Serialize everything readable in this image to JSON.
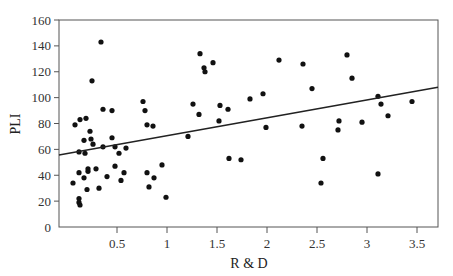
{
  "chart_data": {
    "type": "scatter",
    "title": "",
    "xlabel": "R & D",
    "ylabel": "PLI",
    "xlim": [
      -0.08,
      3.71
    ],
    "ylim": [
      0,
      160
    ],
    "xticks": [
      0.5,
      1,
      1.5,
      2,
      2.5,
      3,
      3.5
    ],
    "xtick_labels": [
      "0.5",
      "1",
      "1.5",
      "2",
      "2.5",
      "3",
      "3.5"
    ],
    "yticks": [
      0,
      20,
      40,
      60,
      80,
      100,
      120,
      140,
      160
    ],
    "ytick_labels": [
      "0",
      "20",
      "40",
      "60",
      "80",
      "100",
      "120",
      "140",
      "160"
    ],
    "grid": false,
    "legend": null,
    "point_color": "#111111",
    "line_color": "#222222",
    "trend_line": {
      "x": [
        -0.08,
        3.71
      ],
      "y": [
        55.6,
        108
      ]
    },
    "points": [
      [
        0.34,
        143
      ],
      [
        0.25,
        113
      ],
      [
        0.36,
        91
      ],
      [
        0.45,
        90
      ],
      [
        0.76,
        97
      ],
      [
        0.78,
        90
      ],
      [
        0.08,
        79
      ],
      [
        0.13,
        83
      ],
      [
        0.19,
        84
      ],
      [
        0.8,
        79
      ],
      [
        0.86,
        78
      ],
      [
        0.23,
        74
      ],
      [
        0.17,
        67
      ],
      [
        0.24,
        68
      ],
      [
        0.26,
        64
      ],
      [
        0.45,
        69
      ],
      [
        0.36,
        62
      ],
      [
        0.48,
        62
      ],
      [
        0.52,
        57
      ],
      [
        0.59,
        61
      ],
      [
        0.12,
        58
      ],
      [
        0.18,
        57
      ],
      [
        0.12,
        42
      ],
      [
        0.21,
        45
      ],
      [
        0.21,
        43
      ],
      [
        0.17,
        38
      ],
      [
        0.29,
        45
      ],
      [
        0.48,
        47
      ],
      [
        0.57,
        42
      ],
      [
        0.4,
        39
      ],
      [
        0.54,
        36
      ],
      [
        0.06,
        34
      ],
      [
        0.2,
        29
      ],
      [
        0.32,
        30
      ],
      [
        0.12,
        22
      ],
      [
        0.12,
        19
      ],
      [
        0.13,
        17
      ],
      [
        0.8,
        42
      ],
      [
        0.87,
        38
      ],
      [
        0.82,
        31
      ],
      [
        0.95,
        48
      ],
      [
        0.99,
        23
      ],
      [
        1.33,
        134
      ],
      [
        1.46,
        127
      ],
      [
        1.37,
        123
      ],
      [
        1.38,
        120
      ],
      [
        1.26,
        95
      ],
      [
        1.32,
        87
      ],
      [
        1.53,
        94
      ],
      [
        1.61,
        91
      ],
      [
        1.52,
        82
      ],
      [
        1.83,
        99
      ],
      [
        1.21,
        70
      ],
      [
        1.62,
        53
      ],
      [
        1.74,
        52
      ],
      [
        2.12,
        129
      ],
      [
        2.36,
        126
      ],
      [
        2.8,
        133
      ],
      [
        2.45,
        107
      ],
      [
        1.96,
        103
      ],
      [
        1.99,
        77
      ],
      [
        2.35,
        78
      ],
      [
        2.72,
        82
      ],
      [
        2.71,
        75
      ],
      [
        2.85,
        115
      ],
      [
        3.11,
        101
      ],
      [
        3.14,
        95
      ],
      [
        3.45,
        97
      ],
      [
        3.21,
        86
      ],
      [
        2.95,
        81
      ],
      [
        2.56,
        53
      ],
      [
        3.11,
        41
      ],
      [
        2.54,
        34
      ]
    ]
  }
}
